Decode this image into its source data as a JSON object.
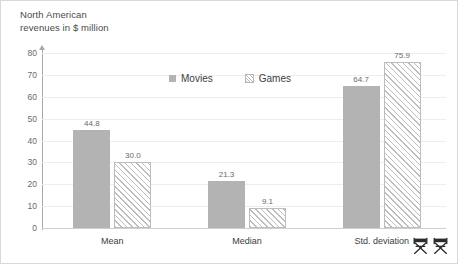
{
  "chart_data": {
    "type": "bar",
    "title_line1": "North American",
    "title_line2": "revenues in $ million",
    "xlabel": "",
    "ylabel": "North American revenues in $ million",
    "ylim": [
      0,
      80
    ],
    "ytick_step": 10,
    "yticks": [
      "0",
      "10",
      "20",
      "30",
      "40",
      "50",
      "60",
      "70",
      "80"
    ],
    "grid": true,
    "grid_axis": "y",
    "legend_position": "top-center",
    "categories": [
      "Mean",
      "Median",
      "Std. deviation"
    ],
    "series": [
      {
        "name": "Movies",
        "fill": "solid",
        "color": "#b3b3b3",
        "values": [
          44.8,
          21.3,
          64.7
        ],
        "labels": [
          "44.8",
          "21.3",
          "64.7"
        ]
      },
      {
        "name": "Games",
        "fill": "diagonal-hatch",
        "color": "#bdbdbd",
        "values": [
          30.0,
          9.1,
          75.9
        ],
        "labels": [
          "30.0",
          "9.1",
          "75.9"
        ]
      }
    ]
  },
  "legend": {
    "items": [
      {
        "label": "Movies"
      },
      {
        "label": "Games"
      }
    ]
  },
  "icons": {
    "chair_left": "directors-chair-icon",
    "chair_right": "directors-chair-icon"
  },
  "colors": {
    "series_movies": "#b3b3b3",
    "series_games": "#bdbdbd",
    "gridline": "#ededed",
    "axis": "#a9a9a9",
    "text": "#3c3c3c",
    "muted_text": "#6a6a6a",
    "border": "#d8d8d8",
    "background": "#ffffff"
  }
}
